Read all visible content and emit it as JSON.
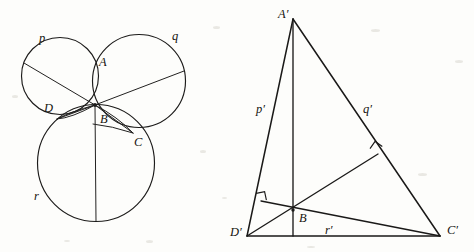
{
  "figure": {
    "background_color": "#fdfdfb",
    "ink_color": "#1c1b1a"
  },
  "left_panel": {
    "name": "circles-construction",
    "common_point": {
      "x": 95,
      "y": 105
    },
    "circles": [
      {
        "id": "p",
        "label": "p",
        "cx": 60,
        "cy": 76,
        "r": 38.5,
        "label_x": 39,
        "label_y": 32
      },
      {
        "id": "q",
        "label": "q",
        "cx": 139,
        "cy": 81,
        "r": 46.5,
        "label_x": 172,
        "label_y": 30
      },
      {
        "id": "r",
        "label": "r",
        "cx": 96,
        "cy": 163,
        "r": 58.5,
        "label_x": 34,
        "label_y": 190
      }
    ],
    "points": [
      {
        "id": "A",
        "label": "A",
        "x": 96,
        "y": 57,
        "label_x": 99,
        "label_y": 56
      },
      {
        "id": "B",
        "label": "B",
        "x": 95,
        "y": 105,
        "label_x": 100,
        "label_y": 113
      },
      {
        "id": "C",
        "label": "C",
        "x": 133,
        "y": 133,
        "label_x": 134,
        "label_y": 136
      },
      {
        "id": "D",
        "label": "D",
        "x": 57,
        "y": 119,
        "label_x": 44,
        "label_y": 102
      }
    ],
    "chords": [
      {
        "id": "chord-p",
        "from": "p-far",
        "to": "common",
        "x1": 24,
        "y1": 63,
        "x2": 95,
        "y2": 105
      },
      {
        "id": "chord-q",
        "from": "common",
        "to": "q-far",
        "x1": 95,
        "y1": 105,
        "x2": 184,
        "y2": 71
      },
      {
        "id": "chord-r",
        "from": "common",
        "to": "r-bottom",
        "x1": 95,
        "y1": 105,
        "x2": 96,
        "y2": 221
      },
      {
        "id": "chord-BD",
        "from": "common",
        "to": "D",
        "x1": 95,
        "y1": 105,
        "x2": 57,
        "y2": 119
      },
      {
        "id": "chord-BC",
        "from": "common",
        "to": "C",
        "x1": 95,
        "y1": 105,
        "x2": 133,
        "y2": 133
      }
    ]
  },
  "right_panel": {
    "name": "triangle-construction",
    "vertices": [
      {
        "id": "A-prime",
        "label": "A′",
        "x": 293,
        "y": 19,
        "label_x": 278,
        "label_y": 8
      },
      {
        "id": "D-prime",
        "label": "D′",
        "x": 247,
        "y": 236,
        "label_x": 230,
        "label_y": 226
      },
      {
        "id": "C-prime",
        "label": "C′",
        "x": 440,
        "y": 236,
        "label_x": 447,
        "label_y": 224
      },
      {
        "id": "B-interior",
        "label": "B",
        "x": 293,
        "y": 210,
        "label_x": 299,
        "label_y": 212
      }
    ],
    "sides": [
      {
        "id": "p-prime",
        "label": "p′",
        "from": "A-prime",
        "to": "D-prime",
        "label_x": 256,
        "label_y": 103
      },
      {
        "id": "q-prime",
        "label": "q′",
        "from": "A-prime",
        "to": "C-prime",
        "label_x": 363,
        "label_y": 103
      },
      {
        "id": "r-prime",
        "label": "r′",
        "from": "D-prime",
        "to": "C-prime",
        "label_x": 325,
        "label_y": 224
      }
    ],
    "cevians": [
      {
        "id": "altitude-from-A",
        "x1": 293,
        "y1": 19,
        "x2": 293,
        "y2": 236,
        "foot_on": "r-prime"
      },
      {
        "id": "altitude-to-p-prime",
        "x1": 293,
        "y1": 210,
        "x2": 261,
        "y2": 201,
        "foot_on": "p-prime"
      },
      {
        "id": "altitude-to-q-prime",
        "x1": 293,
        "y1": 210,
        "x2": 378,
        "y2": 154,
        "foot_on": "q-prime"
      },
      {
        "id": "segment-D-to-q-foot",
        "x1": 247,
        "y1": 236,
        "x2": 378,
        "y2": 154
      },
      {
        "id": "segment-C-to-p-foot",
        "x1": 440,
        "y1": 236,
        "x2": 261,
        "y2": 201
      }
    ],
    "right_angles": [
      {
        "id": "right-angle-p-prime",
        "x": 261,
        "y": 201,
        "size": 9
      },
      {
        "id": "right-angle-q-prime",
        "x": 378,
        "y": 154,
        "size": 9
      }
    ]
  }
}
